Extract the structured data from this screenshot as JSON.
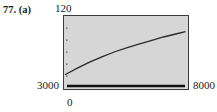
{
  "exercise": {
    "label": "77. (a)"
  },
  "chart_data": {
    "type": "line",
    "title": "",
    "xlabel": "",
    "ylabel": "",
    "xlim": [
      3000,
      8000
    ],
    "ylim": [
      0,
      120
    ],
    "tick_labels": {
      "xmin": "3000",
      "xmax": "8000",
      "ymin": "0",
      "ymax": "120"
    },
    "yticks": [
      20,
      40,
      60,
      80,
      100
    ],
    "grid": false,
    "series": [
      {
        "name": "curve",
        "x": [
          3000,
          3500,
          4000,
          4500,
          5000,
          5500,
          6000,
          6500,
          7000,
          7500,
          7900
        ],
        "y": [
          22,
          33,
          43,
          52,
          60,
          67,
          73,
          79,
          85,
          90,
          94
        ]
      }
    ],
    "colors": {
      "background": "#d6d6d6",
      "line": "#2a2a2a",
      "frame": "#3a3a3a"
    }
  }
}
